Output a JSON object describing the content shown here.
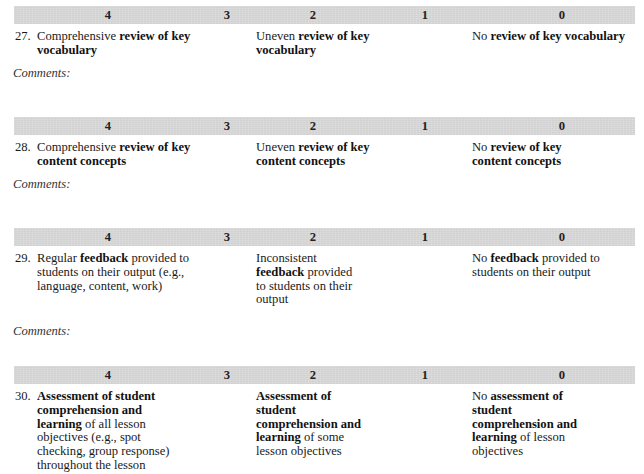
{
  "score_scale": [
    "4",
    "3",
    "2",
    "1",
    "0"
  ],
  "sections": [
    {
      "number": "27.",
      "level_4": [
        {
          "t": "Comprehensive ",
          "b": false
        },
        {
          "t": "review of key vocabulary",
          "b": true
        }
      ],
      "level_2": [
        {
          "t": "Uneven ",
          "b": false
        },
        {
          "t": "review of key vocabulary",
          "b": true
        }
      ],
      "level_0": [
        {
          "t": "No ",
          "b": false
        },
        {
          "t": "review of key vocabulary",
          "b": true
        }
      ],
      "comments_label": "Comments:"
    },
    {
      "number": "28.",
      "level_4": [
        {
          "t": "Comprehensive ",
          "b": false
        },
        {
          "t": "review of key content concepts",
          "b": true
        }
      ],
      "level_2": [
        {
          "t": "Uneven ",
          "b": false
        },
        {
          "t": "review of key content concepts",
          "b": true
        }
      ],
      "level_0": [
        {
          "t": "No ",
          "b": false
        },
        {
          "t": "review of key content concepts",
          "b": true
        }
      ],
      "comments_label": "Comments:"
    },
    {
      "number": "29.",
      "level_4": [
        {
          "t": "Regular ",
          "b": false
        },
        {
          "t": "feedback",
          "b": true
        },
        {
          "t": " provided to students on their output (e.g., language, content, work)",
          "b": false
        }
      ],
      "level_2": [
        {
          "t": "Inconsistent ",
          "b": false
        },
        {
          "t": "feedback",
          "b": true
        },
        {
          "t": " provided to students on their output",
          "b": false
        }
      ],
      "level_0": [
        {
          "t": "No ",
          "b": false
        },
        {
          "t": "feedback",
          "b": true
        },
        {
          "t": " provided to students on their output",
          "b": false
        }
      ],
      "comments_label": "Comments:"
    },
    {
      "number": "30.",
      "level_4": [
        {
          "t": "Assessment of student comprehension and learning",
          "b": true
        },
        {
          "t": " of all lesson objectives (e.g., spot checking, group response) throughout the lesson",
          "b": false
        }
      ],
      "level_2": [
        {
          "t": "Assessment of student comprehension and learning",
          "b": true
        },
        {
          "t": " of some lesson objectives",
          "b": false
        }
      ],
      "level_0": [
        {
          "t": "No ",
          "b": false
        },
        {
          "t": "assessment of student comprehension and learning",
          "b": true
        },
        {
          "t": " of lesson objectives",
          "b": false
        }
      ],
      "comments_label": ""
    }
  ],
  "layout_lines": {
    "s0": {
      "l4": [
        [
          "Comprehensive ",
          "review of key"
        ],
        [
          "",
          "vocabulary"
        ]
      ],
      "l2": [
        [
          "Uneven ",
          "review of key"
        ],
        [
          "",
          "vocabulary"
        ]
      ],
      "l0": [
        [
          "No ",
          "review of key vocabulary"
        ]
      ]
    }
  }
}
